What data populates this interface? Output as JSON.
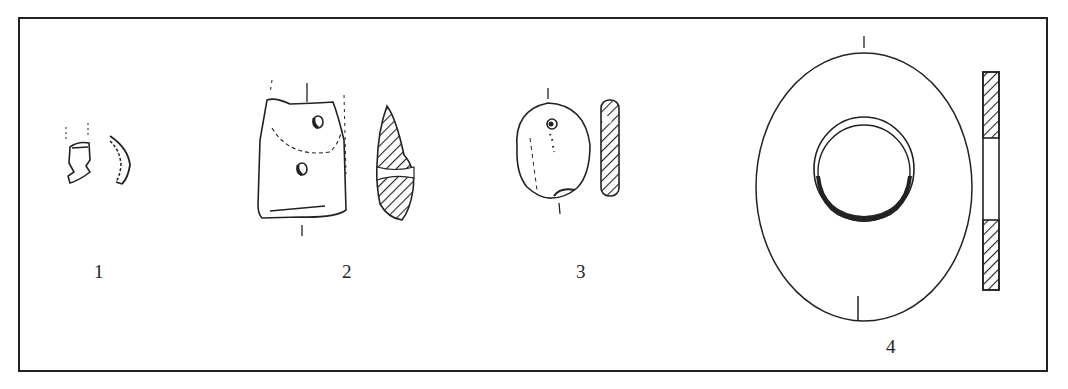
{
  "figure": {
    "type": "archaeological line drawing",
    "objects": [
      {
        "id": 1,
        "label": "1",
        "description": "small fragment with profile section"
      },
      {
        "id": 2,
        "label": "2",
        "description": "rectangular perforated fragment with hatched cross-section"
      },
      {
        "id": 3,
        "label": "3",
        "description": "rounded pebble-shaped object with hatched cross-section"
      },
      {
        "id": 4,
        "label": "4",
        "description": "perforated disc (ring) with hatched cross-section"
      }
    ],
    "colors": {
      "ink": "#222222",
      "background": "#ffffff"
    }
  }
}
